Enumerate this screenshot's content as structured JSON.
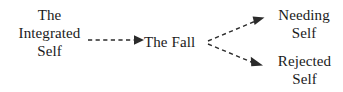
{
  "diagram": {
    "background_color": "#ffffff",
    "line_color": "#2b2b2b",
    "text_color": "#1a1a1a",
    "nodes": [
      {
        "id": "integrated-self",
        "text": "The\nIntegrated\nSelf",
        "lines": [
          "The",
          "Integrated",
          "Self"
        ]
      },
      {
        "id": "the-fall",
        "text": "The Fall",
        "lines": [
          "The Fall"
        ]
      },
      {
        "id": "needing-self",
        "text": "Needing\nSelf",
        "lines": [
          "Needing",
          "Self"
        ]
      },
      {
        "id": "rejected-self",
        "text": "Rejected\nSelf",
        "lines": [
          "Rejected",
          "Self"
        ]
      }
    ],
    "edges": [
      {
        "id": "edge-integrated-to-fall",
        "from": "integrated-self",
        "to": "the-fall",
        "style": "dashed",
        "arrowhead": "filled-triangle",
        "label": ""
      },
      {
        "id": "edge-fall-to-needing",
        "from": "the-fall",
        "to": "needing-self",
        "style": "dashed",
        "arrowhead": "filled-triangle",
        "label": ""
      },
      {
        "id": "edge-fall-to-rejected",
        "from": "the-fall",
        "to": "rejected-self",
        "style": "dashed",
        "arrowhead": "filled-triangle",
        "label": ""
      }
    ]
  }
}
